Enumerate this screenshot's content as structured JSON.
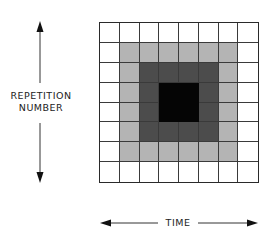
{
  "diagram": {
    "y_axis_label_line1": "REPETITION",
    "y_axis_label_line2": "NUMBER",
    "x_axis_label": "TIME",
    "grid": {
      "rows": 8,
      "cols": 8,
      "levels": [
        [
          0,
          0,
          0,
          0,
          0,
          0,
          0,
          0
        ],
        [
          0,
          1,
          1,
          1,
          1,
          1,
          1,
          0
        ],
        [
          0,
          1,
          2,
          2,
          2,
          2,
          1,
          0
        ],
        [
          0,
          1,
          2,
          3,
          3,
          2,
          1,
          0
        ],
        [
          0,
          1,
          2,
          3,
          3,
          2,
          1,
          0
        ],
        [
          0,
          1,
          2,
          2,
          2,
          2,
          1,
          0
        ],
        [
          0,
          1,
          1,
          1,
          1,
          1,
          1,
          0
        ],
        [
          0,
          0,
          0,
          0,
          0,
          0,
          0,
          0
        ]
      ],
      "level_colors": [
        "#ffffff",
        "#b4b4b4",
        "#4c4c4c",
        "#050505"
      ]
    },
    "arrows": {
      "vertical": "double-headed arrow indicating repetition number",
      "horizontal": "double-headed arrow indicating time"
    }
  }
}
